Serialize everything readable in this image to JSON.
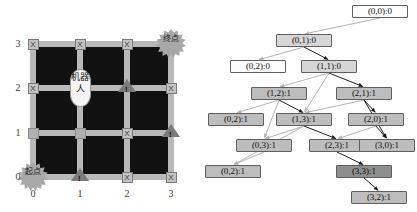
{
  "figure": {
    "left_panel": {
      "title": "grid-map",
      "x_axis": {
        "ticks": [
          "0",
          "1",
          "2",
          "3"
        ]
      },
      "y_axis": {
        "ticks": [
          "3",
          "2",
          "1",
          "0"
        ]
      },
      "robot": {
        "label": "机器人",
        "cell": [
          1,
          2
        ]
      },
      "start_badge": {
        "label": "起点",
        "cell": [
          0,
          0
        ]
      },
      "goal_badge": {
        "label": "终点",
        "cell": [
          3,
          3
        ]
      },
      "markers": [
        {
          "cell": [
            0,
            3
          ],
          "glyph": "X",
          "kind": "x"
        },
        {
          "cell": [
            1,
            3
          ],
          "glyph": "X",
          "kind": "x"
        },
        {
          "cell": [
            2,
            3
          ],
          "glyph": "X",
          "kind": "x"
        },
        {
          "cell": [
            0,
            2
          ],
          "glyph": "X",
          "kind": "x"
        },
        {
          "cell": [
            2,
            2
          ],
          "glyph": "!",
          "kind": "triangle"
        },
        {
          "cell": [
            3,
            2
          ],
          "glyph": "X",
          "kind": "x"
        },
        {
          "cell": [
            0,
            1
          ],
          "glyph": "",
          "kind": "blank"
        },
        {
          "cell": [
            1,
            1
          ],
          "glyph": "",
          "kind": "blank"
        },
        {
          "cell": [
            2,
            1
          ],
          "glyph": "X",
          "kind": "x"
        },
        {
          "cell": [
            3,
            1
          ],
          "glyph": "!",
          "kind": "triangle"
        },
        {
          "cell": [
            1,
            0
          ],
          "glyph": "!",
          "kind": "triangle"
        },
        {
          "cell": [
            2,
            0
          ],
          "glyph": "X",
          "kind": "x"
        },
        {
          "cell": [
            3,
            0
          ],
          "glyph": "X",
          "kind": "x"
        }
      ]
    },
    "right_panel": {
      "title": "search-tree",
      "nodes": [
        {
          "id": "n0",
          "label": "(0,0):0",
          "x": 152,
          "y": 5,
          "w": 56,
          "shade": "lvl-white"
        },
        {
          "id": "n1",
          "label": "(0,1):0",
          "x": 76,
          "y": 34,
          "w": 56,
          "shade": "lvl-light"
        },
        {
          "id": "n2",
          "label": "(0,2):0",
          "x": 30,
          "y": 60,
          "w": 56,
          "shade": "lvl-white"
        },
        {
          "id": "n3",
          "label": "(1,1):0",
          "x": 101,
          "y": 60,
          "w": 56,
          "shade": "lvl-light"
        },
        {
          "id": "n4",
          "label": "(1,2):1",
          "x": 51,
          "y": 87,
          "w": 56,
          "shade": "lvl-mid"
        },
        {
          "id": "n5",
          "label": "(2,1):1",
          "x": 136,
          "y": 87,
          "w": 56,
          "shade": "lvl-mid"
        },
        {
          "id": "n6",
          "label": "(0,2):1",
          "x": 8,
          "y": 113,
          "w": 56,
          "shade": "lvl-mid"
        },
        {
          "id": "n7",
          "label": "(1,3):1",
          "x": 76,
          "y": 113,
          "w": 56,
          "shade": "lvl-mid"
        },
        {
          "id": "n8",
          "label": "(2,0):1",
          "x": 148,
          "y": 113,
          "w": 56,
          "shade": "lvl-mid"
        },
        {
          "id": "n9",
          "label": "(0,3):1",
          "x": 36,
          "y": 139,
          "w": 56,
          "shade": "lvl-mid"
        },
        {
          "id": "n10",
          "label": "(2,3):1",
          "x": 109,
          "y": 139,
          "w": 56,
          "shade": "lvl-mid"
        },
        {
          "id": "n11",
          "label": "(3,0):1",
          "x": 159,
          "y": 139,
          "w": 56,
          "shade": "lvl-mid"
        },
        {
          "id": "n12",
          "label": "(0,2):1",
          "x": 5,
          "y": 165,
          "w": 56,
          "shade": "lvl-mid"
        },
        {
          "id": "n13",
          "label": "(3,3):1",
          "x": 136,
          "y": 165,
          "w": 56,
          "shade": "lvl-dark"
        },
        {
          "id": "n14",
          "label": "(3,2):1",
          "x": 151,
          "y": 191,
          "w": 56,
          "shade": "lvl-mid"
        }
      ],
      "edges": [
        {
          "from": "n0",
          "to": "n1"
        },
        {
          "from": "n1",
          "to": "n2"
        },
        {
          "from": "n1",
          "to": "n3"
        },
        {
          "from": "n3",
          "to": "n4"
        },
        {
          "from": "n3",
          "to": "n7"
        },
        {
          "from": "n3",
          "to": "n5"
        },
        {
          "from": "n4",
          "to": "n6"
        },
        {
          "from": "n4",
          "to": "n9"
        },
        {
          "from": "n4",
          "to": "n7"
        },
        {
          "from": "n5",
          "to": "n7"
        },
        {
          "from": "n5",
          "to": "n8"
        },
        {
          "from": "n5",
          "to": "n11"
        },
        {
          "from": "n7",
          "to": "n9"
        },
        {
          "from": "n7",
          "to": "n12"
        },
        {
          "from": "n7",
          "to": "n10"
        },
        {
          "from": "n8",
          "to": "n10"
        },
        {
          "from": "n8",
          "to": "n11"
        },
        {
          "from": "n9",
          "to": "n12"
        },
        {
          "from": "n10",
          "to": "n13"
        },
        {
          "from": "n13",
          "to": "n14"
        }
      ]
    }
  }
}
